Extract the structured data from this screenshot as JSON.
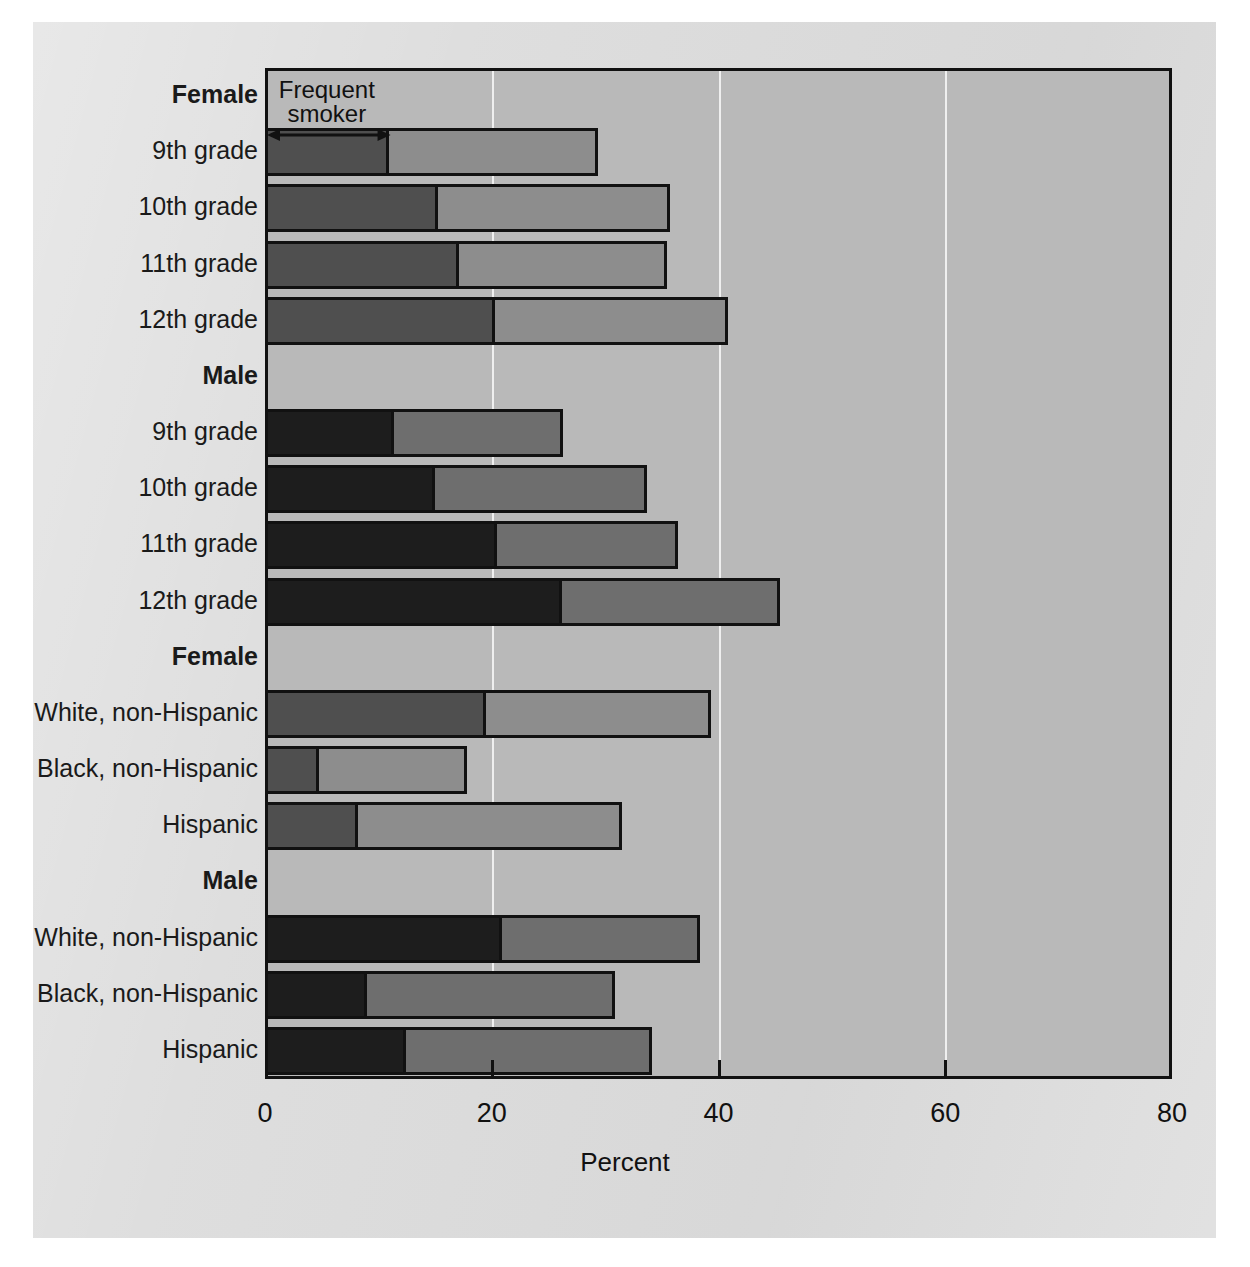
{
  "chart_data": {
    "type": "bar",
    "orientation": "horizontal",
    "stacked": true,
    "title": "",
    "xlabel": "Percent",
    "ylabel": "",
    "xlim": [
      0,
      80
    ],
    "xticks": [
      0,
      20,
      40,
      60,
      80
    ],
    "xtick_labels": [
      "0",
      "20",
      "40",
      "60",
      "80"
    ],
    "gridlines": [
      20,
      40,
      60
    ],
    "grid": true,
    "legend_position": "in-plot-annotation",
    "annotations": [
      {
        "text": "Frequent\nsmoker",
        "line1": "Frequent",
        "line2": "smoker",
        "type": "double-arrow-span",
        "spans": [
          0,
          10.9
        ]
      }
    ],
    "series": [
      {
        "name": "Frequent smoker",
        "key": "frequent"
      },
      {
        "name": "Any current use (remainder)",
        "key": "remainder"
      }
    ],
    "groups": [
      {
        "header": "Female",
        "header_bold": true,
        "shade": "light",
        "rows": [
          {
            "label": "9th grade",
            "frequent": 10.9,
            "total": 29.4
          },
          {
            "label": "10th grade",
            "frequent": 15.3,
            "total": 35.7
          },
          {
            "label": "11th grade",
            "frequent": 17.1,
            "total": 35.5
          },
          {
            "label": "12th grade",
            "frequent": 20.3,
            "total": 40.8
          }
        ]
      },
      {
        "header": "Male",
        "header_bold": true,
        "shade": "dark",
        "rows": [
          {
            "label": "9th grade",
            "frequent": 11.4,
            "total": 26.3
          },
          {
            "label": "10th grade",
            "frequent": 15.0,
            "total": 33.7
          },
          {
            "label": "11th grade",
            "frequent": 20.5,
            "total": 36.4
          },
          {
            "label": "12th grade",
            "frequent": 26.2,
            "total": 45.4
          }
        ]
      },
      {
        "header": "Female",
        "header_bold": true,
        "shade": "light",
        "rows": [
          {
            "label": "White, non-Hispanic",
            "frequent": 19.5,
            "total": 39.3
          },
          {
            "label": "Black, non-Hispanic",
            "frequent": 4.8,
            "total": 17.8
          },
          {
            "label": "Hispanic",
            "frequent": 8.2,
            "total": 31.5
          }
        ]
      },
      {
        "header": "Male",
        "header_bold": true,
        "shade": "dark",
        "rows": [
          {
            "label": "White, non-Hispanic",
            "frequent": 20.9,
            "total": 38.4
          },
          {
            "label": "Black, non-Hispanic",
            "frequent": 9.0,
            "total": 30.9
          },
          {
            "label": "Hispanic",
            "frequent": 12.4,
            "total": 34.1
          }
        ]
      }
    ]
  },
  "colors": {
    "page_background": "#ffffff",
    "panel_background": "#dcdcdc",
    "plot_background": "#b9b9b9",
    "gridline": "#efefef",
    "axis_line": "#111111",
    "female_frequent": "#4f4f4f",
    "female_remainder": "#8d8d8d",
    "male_frequent": "#1d1d1d",
    "male_remainder": "#6e6e6e",
    "text": "#111111"
  }
}
